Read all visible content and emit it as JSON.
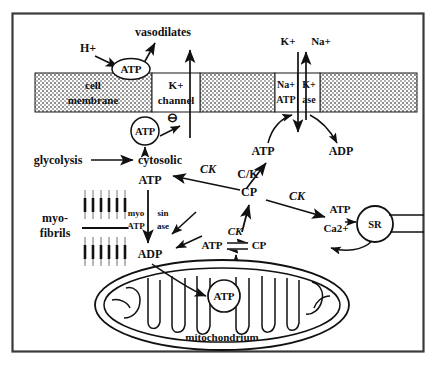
{
  "figure": {
    "frame_color": "#3a3a3a",
    "ink_color": "#111111",
    "membrane_fill": "#c9c9c9"
  },
  "membrane": {
    "cell_membrane_line1": "cell",
    "cell_membrane_line2": "membrane",
    "k_channel_line1": "K+",
    "k_channel_line2": "channel",
    "pump_left_line1": "Na+",
    "pump_left_line2": "ATP",
    "pump_right_line1": "K+",
    "pump_right_line2": "ase"
  },
  "top": {
    "h_plus": "H+",
    "vasodilates": "vasodilates",
    "atp_extracellular": "ATP",
    "k_out": "K+",
    "na_out": "Na+"
  },
  "cytosol": {
    "atp_gate": "ATP",
    "minus_sign": "⊖",
    "glycolysis": "glycolysis",
    "cytosolic": "cytosolic",
    "cytosolic_atp": "ATP",
    "ck_to_cytosolic": "CK",
    "atp_pump_substrate": "ATP",
    "adp_pump_product": "ADP",
    "ck_pump": "C/K"
  },
  "myofibrils": {
    "label_line1": "myo-",
    "label_line2": "fibrils",
    "atpase_line1_left": "myo",
    "atpase_line1_right": "sin",
    "atpase_line2_left": "ATP",
    "atpase_line2_right": "ase",
    "adp": "ADP"
  },
  "shuttle": {
    "cp_hub": "CP",
    "ck_right": "CK",
    "ck_mito": "CK",
    "atp_mito_side": "ATP",
    "cp_mito_side": "CP"
  },
  "sr": {
    "atp": "ATP",
    "calcium": "Ca2+",
    "label": "SR"
  },
  "mitochondrion": {
    "label": "mitochondrium",
    "atp": "ATP"
  }
}
